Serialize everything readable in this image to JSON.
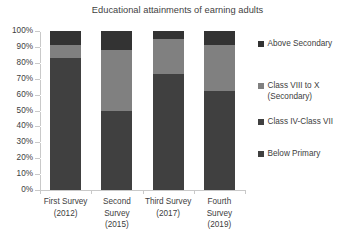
{
  "chart_data": {
    "type": "bar",
    "subtype": "stacked-bar-100-percent",
    "title": "Educational attainments of earning adults",
    "xlabel": "",
    "ylabel": "",
    "ylim": [
      0,
      100
    ],
    "y_tick_labels": [
      "100%",
      "90%",
      "80%",
      "70%",
      "60%",
      "50%",
      "40%",
      "30%",
      "20%",
      "10%",
      "0%"
    ],
    "y_tick_values": [
      100,
      90,
      80,
      70,
      60,
      50,
      40,
      30,
      20,
      10,
      0
    ],
    "grid": true,
    "legend_position": "right",
    "categories": [
      "First Survey (2012)",
      "Second Survey (2015)",
      "Third Survey (2017)",
      "Fourth Survey (2019)"
    ],
    "category_lines": [
      [
        "First Survey",
        "(2012)"
      ],
      [
        "Second",
        "Survey",
        "(2015)"
      ],
      [
        "Third Survey",
        "(2017)"
      ],
      [
        "Fourth",
        "Survey",
        "(2019)"
      ]
    ],
    "series": [
      {
        "name": "Below Primary",
        "color": "#404040",
        "values": [
          83,
          50,
          73,
          62
        ]
      },
      {
        "name": "Class IV-Class VII",
        "color": "#404040",
        "values": [
          0,
          0,
          0,
          0
        ]
      },
      {
        "name": "Class VIII to X (Secondary)",
        "color": "#808080",
        "values": [
          8,
          38,
          22,
          29
        ]
      },
      {
        "name": "Above Secondary",
        "color": "#333333",
        "values": [
          9,
          12,
          5,
          9
        ]
      }
    ],
    "stack_order_bottom_to_top": [
      "Below Primary",
      "Class IV-Class VII",
      "Class VIII to X (Secondary)",
      "Above Secondary"
    ],
    "legend_entries_top_to_bottom": [
      {
        "label": "Above Secondary",
        "color": "#333333"
      },
      {
        "label": "Class VIII to X (Secondary)",
        "color": "#808080",
        "lines": [
          "Class VIII to X",
          "(Secondary)"
        ]
      },
      {
        "label": "Class IV-Class VII",
        "color": "#404040"
      },
      {
        "label": "Below Primary",
        "color": "#404040"
      }
    ]
  },
  "legend": {
    "items": [
      {
        "label": "Above Secondary",
        "line1": "Above Secondary",
        "line2": ""
      },
      {
        "label": "Class VIII to X (Secondary)",
        "line1": "Class VIII to X",
        "line2": "(Secondary)"
      },
      {
        "label": "Class IV-Class VII",
        "line1": "Class IV-Class VII",
        "line2": ""
      },
      {
        "label": "Below Primary",
        "line1": "Below Primary",
        "line2": ""
      }
    ]
  },
  "axis": {
    "y_labels": [
      "100%",
      "90%",
      "80%",
      "70%",
      "60%",
      "50%",
      "40%",
      "30%",
      "20%",
      "10%",
      "0%"
    ],
    "x_labels": [
      {
        "line1": "First Survey",
        "line2": "(2012)",
        "line3": ""
      },
      {
        "line1": "Second",
        "line2": "Survey",
        "line3": "(2015)"
      },
      {
        "line1": "Third Survey",
        "line2": "(2017)",
        "line3": ""
      },
      {
        "line1": "Fourth",
        "line2": "Survey",
        "line3": "(2019)"
      }
    ]
  },
  "colors": {
    "above_secondary": "#333333",
    "secondary": "#808080",
    "class_iv_vii": "#404040",
    "below_primary": "#404040",
    "plot_background": "#ffffff",
    "axis": "#c9c9c9"
  }
}
